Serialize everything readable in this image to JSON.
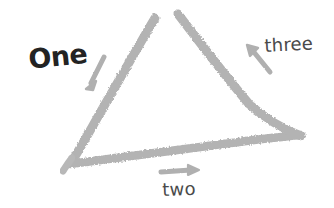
{
  "canvas": {
    "width": 334,
    "height": 208,
    "background_color": "#ffffff",
    "title": "Hand-drawn triangle with three labeled sides"
  },
  "diagram": {
    "shape": "triangle",
    "stroke_color": "#b3b3b3",
    "stroke_style": "hand-drawn-marker",
    "stroke_width": 9,
    "apex_open": true,
    "vertices": [
      {
        "name": "apex-left-end",
        "x": 155,
        "y": 17
      },
      {
        "name": "apex-right-end",
        "x": 178,
        "y": 13
      },
      {
        "name": "bottom-left",
        "x": 70,
        "y": 163
      },
      {
        "name": "bottom-right",
        "x": 300,
        "y": 135
      }
    ],
    "sides": [
      {
        "name": "left-side",
        "label": "One",
        "from": "apex-left-end",
        "to": "bottom-left"
      },
      {
        "name": "bottom-side",
        "label": "two",
        "from": "bottom-left",
        "to": "bottom-right"
      },
      {
        "name": "right-side",
        "label": "three",
        "from": "bottom-right",
        "to": "apex-right-end"
      }
    ]
  },
  "labels": {
    "one": {
      "text": "One",
      "color": "#232323",
      "weight": "bold",
      "x": 27,
      "y": 46
    },
    "two": {
      "text": "two",
      "color": "#4a4a4a",
      "weight": "normal",
      "x": 162,
      "y": 181
    },
    "three": {
      "text": "three",
      "color": "#4a4a4a",
      "weight": "normal",
      "x": 264,
      "y": 37
    }
  },
  "arrows": {
    "color": "#b0b0b0",
    "items": [
      {
        "name": "arrow-one",
        "points_to": "left-side",
        "direction": "down-left",
        "tail_x": 104,
        "tail_y": 57,
        "head_x": 88,
        "head_y": 88
      },
      {
        "name": "arrow-two",
        "points_to": "bottom-side",
        "direction": "right",
        "tail_x": 161,
        "tail_y": 172,
        "head_x": 197,
        "head_y": 170
      },
      {
        "name": "arrow-three",
        "points_to": "right-side",
        "direction": "up-left",
        "tail_x": 270,
        "tail_y": 72,
        "head_x": 248,
        "head_y": 47
      }
    ]
  }
}
